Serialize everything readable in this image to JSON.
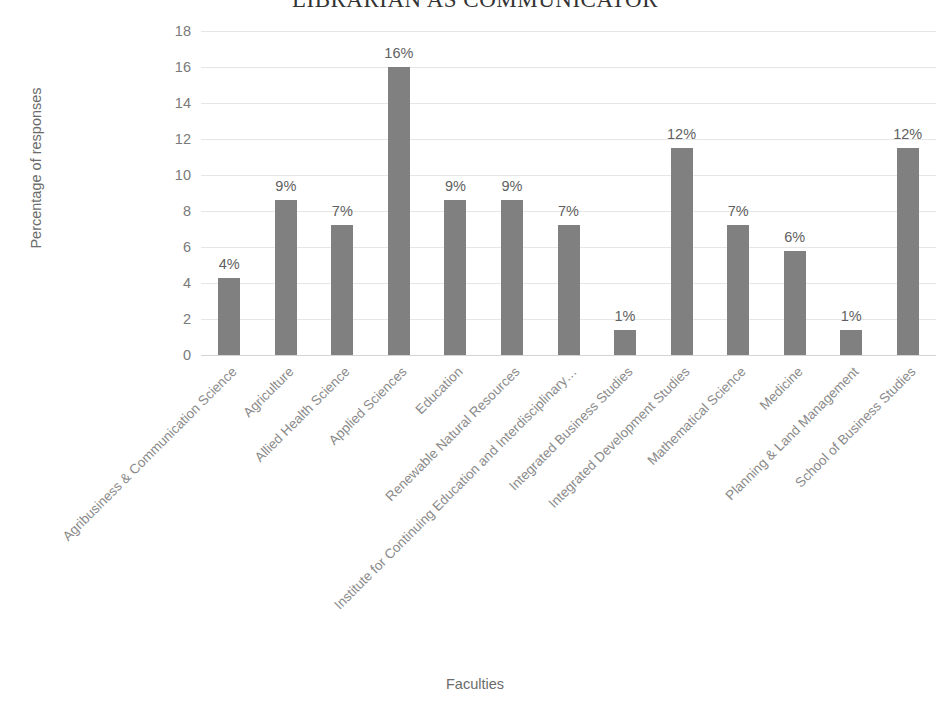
{
  "chart_data": {
    "type": "bar",
    "title": "LIBRARIAN AS COMMUNICATOR",
    "xlabel": "Faculties",
    "ylabel": "Percentage of responses",
    "ylim": [
      0,
      18
    ],
    "y_ticks": [
      0,
      2,
      4,
      6,
      8,
      10,
      12,
      14,
      16,
      18
    ],
    "grid": true,
    "legend": "none",
    "bar_color": "#808080",
    "gridline_color": "#e6e6e6",
    "label_color": "#8a8a8a",
    "categories": [
      "Agribusiness & Communication Science",
      "Agriculture",
      "Allied Health Science",
      "Applied Sciences",
      "Education",
      "Renewable Natural Resources",
      "Institute for Continuing Education and Interdisciplinary…",
      "Integrated Business Studies",
      "Integrated Development Studies",
      "Mathematical Science",
      "Medicine",
      "Planning & Land Management",
      "School of Business Studies"
    ],
    "values": [
      4.3,
      8.6,
      7.2,
      16.0,
      8.6,
      8.6,
      7.2,
      1.4,
      11.5,
      7.2,
      5.8,
      1.4,
      11.5
    ],
    "data_labels": [
      "4%",
      "9%",
      "7%",
      "16%",
      "9%",
      "9%",
      "7%",
      "1%",
      "12%",
      "7%",
      "6%",
      "1%",
      "12%"
    ]
  }
}
